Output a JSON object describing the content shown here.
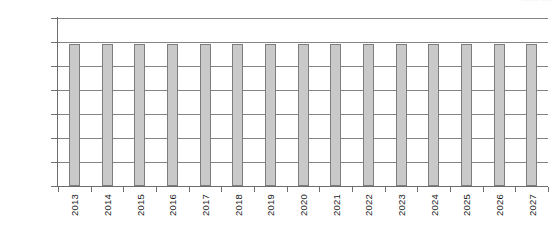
{
  "header": {
    "clipped_text": "........ ...."
  },
  "chart_data": {
    "type": "bar",
    "title": "",
    "subtitle": "",
    "xlabel": "",
    "ylabel": "",
    "categories": [
      "2013",
      "2014",
      "2015",
      "2016",
      "2017",
      "2018",
      "2019",
      "2020",
      "2021",
      "2022",
      "2023",
      "2024",
      "2025",
      "2026",
      "2027"
    ],
    "values": [
      29500,
      29500,
      29500,
      29500,
      29500,
      29500,
      29500,
      29500,
      29500,
      29500,
      29500,
      29500,
      29500,
      29500,
      29500
    ],
    "ylim": [
      0,
      35000
    ],
    "ytick_values": [
      0,
      5000,
      10000,
      15000,
      20000,
      25000,
      30000,
      35000
    ],
    "ytick_labels": [
      "0",
      "£5,000",
      "£10,000",
      "£15,000",
      "£20,000",
      "£25,000",
      "£30,000",
      "£35,000"
    ],
    "xtick_labels": [
      "2013",
      "2014",
      "2015",
      "2016",
      "2017",
      "2018",
      "2019",
      "2020",
      "2021",
      "2022",
      "2023",
      "2024",
      "2025",
      "2026",
      "2027"
    ],
    "grid": true,
    "grid_axis": "y",
    "legend": false,
    "legend_position": "none",
    "annotations": [],
    "series": [
      {
        "name": "",
        "values": [
          29500,
          29500,
          29500,
          29500,
          29500,
          29500,
          29500,
          29500,
          29500,
          29500,
          29500,
          29500,
          29500,
          29500,
          29500
        ]
      }
    ],
    "colors": {
      "bar_fill": "#c9c9c9",
      "bar_stroke": "#7d7d7d",
      "gridline": "#848484",
      "axis": "#6d6d6d",
      "text": "#1a1a1a",
      "background": "#ffffff"
    }
  }
}
